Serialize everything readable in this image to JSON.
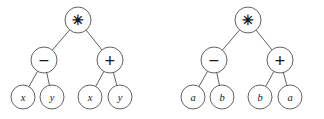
{
  "figure": {
    "type": "expression-trees",
    "background_color": "#ffffff",
    "stroke_color": "#5a5a5a",
    "text_color": "#1a1a1a",
    "count": 2
  },
  "trees": [
    {
      "id": "left-tree",
      "name": "expression-tree-xy",
      "expression": "(x - y) * (x + y)",
      "nodes": [
        {
          "id": "L-root",
          "name": "node-root-multiply",
          "label": "✳",
          "glyph_name": "asterisk-operator",
          "kind": "operator",
          "cx": 78,
          "cy": 20,
          "r": 13
        },
        {
          "id": "L-minus",
          "name": "node-subtract",
          "label": "−",
          "glyph_name": "minus-operator",
          "kind": "operator",
          "cx": 44,
          "cy": 60,
          "r": 13
        },
        {
          "id": "L-plus",
          "name": "node-add",
          "label": "+",
          "glyph_name": "plus-operator",
          "kind": "operator",
          "cx": 110,
          "cy": 60,
          "r": 13
        },
        {
          "id": "L-x1",
          "name": "leaf-x-1",
          "label": "x",
          "glyph_name": "variable-x",
          "kind": "leaf",
          "cx": 23,
          "cy": 97,
          "r": 12
        },
        {
          "id": "L-y1",
          "name": "leaf-y-1",
          "label": "y",
          "glyph_name": "variable-y",
          "kind": "leaf",
          "cx": 52,
          "cy": 97,
          "r": 12
        },
        {
          "id": "L-x2",
          "name": "leaf-x-2",
          "label": "x",
          "glyph_name": "variable-x",
          "kind": "leaf",
          "cx": 90,
          "cy": 97,
          "r": 12
        },
        {
          "id": "L-y2",
          "name": "leaf-y-2",
          "label": "y",
          "glyph_name": "variable-y",
          "kind": "leaf",
          "cx": 120,
          "cy": 97,
          "r": 12
        }
      ],
      "edges": [
        {
          "name": "edge-root-to-subtract",
          "from": "L-root",
          "to": "L-minus"
        },
        {
          "name": "edge-root-to-add",
          "from": "L-root",
          "to": "L-plus"
        },
        {
          "name": "edge-subtract-to-x",
          "from": "L-minus",
          "to": "L-x1"
        },
        {
          "name": "edge-subtract-to-y",
          "from": "L-minus",
          "to": "L-y1"
        },
        {
          "name": "edge-add-to-x",
          "from": "L-plus",
          "to": "L-x2"
        },
        {
          "name": "edge-add-to-y",
          "from": "L-plus",
          "to": "L-y2"
        }
      ]
    },
    {
      "id": "right-tree",
      "name": "expression-tree-ab",
      "expression": "(a - b) * (b + a)",
      "nodes": [
        {
          "id": "R-root",
          "name": "node-root-multiply",
          "label": "✳",
          "glyph_name": "asterisk-operator",
          "kind": "operator",
          "cx": 248,
          "cy": 20,
          "r": 13
        },
        {
          "id": "R-minus",
          "name": "node-subtract",
          "label": "−",
          "glyph_name": "minus-operator",
          "kind": "operator",
          "cx": 214,
          "cy": 60,
          "r": 13
        },
        {
          "id": "R-plus",
          "name": "node-add",
          "label": "+",
          "glyph_name": "plus-operator",
          "kind": "operator",
          "cx": 280,
          "cy": 60,
          "r": 13
        },
        {
          "id": "R-a1",
          "name": "leaf-a-1",
          "label": "a",
          "glyph_name": "variable-a",
          "kind": "leaf",
          "cx": 193,
          "cy": 97,
          "r": 12
        },
        {
          "id": "R-b1",
          "name": "leaf-b-1",
          "label": "b",
          "glyph_name": "variable-b",
          "kind": "leaf",
          "cx": 222,
          "cy": 97,
          "r": 12
        },
        {
          "id": "R-b2",
          "name": "leaf-b-2",
          "label": "b",
          "glyph_name": "variable-b",
          "kind": "leaf",
          "cx": 260,
          "cy": 97,
          "r": 12
        },
        {
          "id": "R-a2",
          "name": "leaf-a-2",
          "label": "a",
          "glyph_name": "variable-a",
          "kind": "leaf",
          "cx": 290,
          "cy": 97,
          "r": 12
        }
      ],
      "edges": [
        {
          "name": "edge-root-to-subtract",
          "from": "R-root",
          "to": "R-minus"
        },
        {
          "name": "edge-root-to-add",
          "from": "R-root",
          "to": "R-plus"
        },
        {
          "name": "edge-subtract-to-a",
          "from": "R-minus",
          "to": "R-a1"
        },
        {
          "name": "edge-subtract-to-b",
          "from": "R-minus",
          "to": "R-b1"
        },
        {
          "name": "edge-add-to-b",
          "from": "R-plus",
          "to": "R-b2"
        },
        {
          "name": "edge-add-to-a",
          "from": "R-plus",
          "to": "R-a2"
        }
      ]
    }
  ]
}
